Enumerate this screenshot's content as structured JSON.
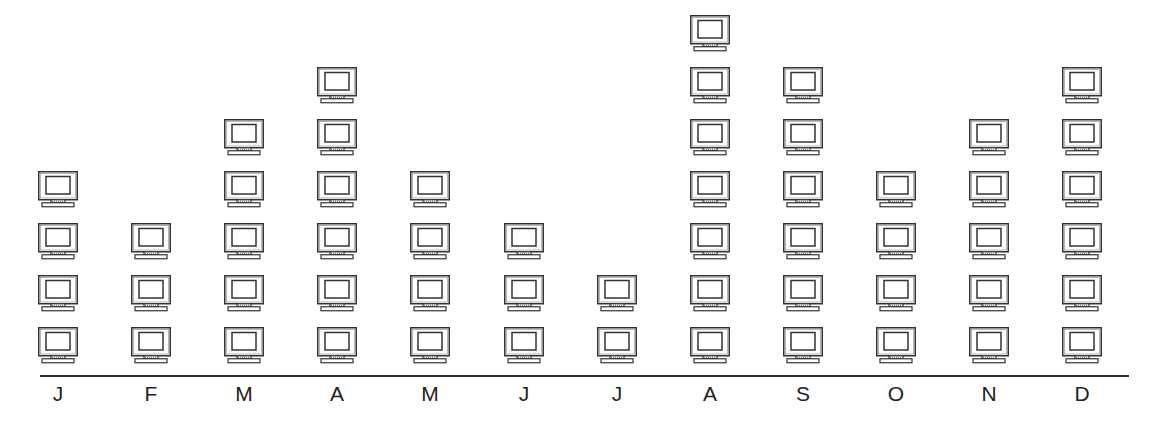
{
  "chart_data": {
    "type": "pictograph",
    "title": "",
    "xlabel": "",
    "ylabel": "",
    "icon": "computer-monitor-icon",
    "categories": [
      "J",
      "F",
      "M",
      "A",
      "M",
      "J",
      "J",
      "A",
      "S",
      "O",
      "N",
      "D"
    ],
    "values": [
      4,
      3,
      5,
      6,
      4,
      3,
      2,
      7,
      6,
      4,
      5,
      6
    ],
    "grid": false,
    "legend": null
  },
  "colors": {
    "stroke": "#333333",
    "background": "#ffffff"
  }
}
